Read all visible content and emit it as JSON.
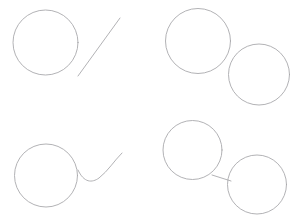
{
  "canvas": {
    "width": 302,
    "height": 221,
    "background_color": "#ffffff",
    "stroke_color": "#a9a9ad",
    "stroke_width": 0.9
  },
  "chart_data": {
    "type": "scatter",
    "title": "",
    "xlabel": "",
    "ylabel": "",
    "grid": false,
    "legend_position": "none",
    "xlim": [
      0,
      302
    ],
    "ylim": [
      0,
      221
    ],
    "panels": [
      {
        "id": "panel-top-left",
        "position": "top-left",
        "shape_count": 2,
        "shapes": [
          {
            "kind": "circle",
            "name": "circle",
            "cx": 45.5,
            "cy": 42.5,
            "r": 32.5
          },
          {
            "kind": "line",
            "name": "diagonal-line",
            "x1": 78,
            "y1": 76,
            "x2": 120,
            "y2": 18
          }
        ]
      },
      {
        "id": "panel-top-right",
        "position": "top-right",
        "shape_count": 2,
        "shapes": [
          {
            "kind": "circle",
            "name": "upper-left-circle",
            "cx": 198,
            "cy": 41,
            "r": 32.5
          },
          {
            "kind": "circle",
            "name": "lower-right-circle",
            "cx": 259,
            "cy": 74.5,
            "r": 30.5
          }
        ]
      },
      {
        "id": "panel-bottom-left",
        "position": "bottom-left",
        "shape_count": 2,
        "shapes": [
          {
            "kind": "circle",
            "name": "circle",
            "cx": 46,
            "cy": 175.5,
            "r": 31.5
          },
          {
            "kind": "curve",
            "name": "curved-tail",
            "path": "M 78 170 C 84 183 92 183 99 178 C 108 171 114 161 122 153"
          }
        ]
      },
      {
        "id": "panel-bottom-right",
        "position": "bottom-right",
        "shape_count": 3,
        "shapes": [
          {
            "kind": "circle",
            "name": "upper-left-circle",
            "cx": 192.5,
            "cy": 150,
            "r": 29.5
          },
          {
            "kind": "circle",
            "name": "lower-right-circle",
            "cx": 257,
            "cy": 184.5,
            "r": 29.5
          },
          {
            "kind": "line",
            "name": "connecting-segment",
            "x1": 212,
            "y1": 175,
            "x2": 231,
            "y2": 181
          }
        ]
      }
    ]
  }
}
